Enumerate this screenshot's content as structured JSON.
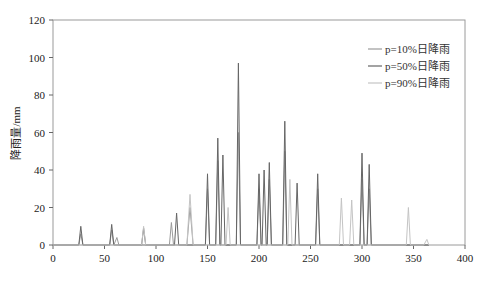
{
  "chart_data": {
    "type": "line",
    "title": "",
    "xlabel": "",
    "ylabel": "降雨量/mm",
    "xlim": [
      0,
      400
    ],
    "ylim": [
      0,
      120
    ],
    "x_ticks": [
      0,
      50,
      100,
      150,
      200,
      250,
      300,
      350,
      400
    ],
    "y_ticks": [
      0,
      20,
      40,
      60,
      80,
      100,
      120
    ],
    "grid": false,
    "legend_position": "upper-right",
    "series": [
      {
        "name": "p=10%日降雨",
        "color": "#9a9a9a",
        "points": [
          [
            0,
            0
          ],
          [
            25,
            0
          ],
          [
            27,
            6
          ],
          [
            29,
            0
          ],
          [
            55,
            0
          ],
          [
            57,
            8
          ],
          [
            59,
            0
          ],
          [
            62,
            4
          ],
          [
            64,
            0
          ],
          [
            113,
            0
          ],
          [
            115,
            12
          ],
          [
            117,
            0
          ],
          [
            130,
            0
          ],
          [
            133,
            20
          ],
          [
            136,
            0
          ],
          [
            148,
            0
          ],
          [
            150,
            30
          ],
          [
            152,
            0
          ],
          [
            158,
            0
          ],
          [
            160,
            45
          ],
          [
            162,
            0
          ],
          [
            178,
            0
          ],
          [
            180,
            60
          ],
          [
            182,
            0
          ],
          [
            198,
            0
          ],
          [
            200,
            30
          ],
          [
            202,
            0
          ],
          [
            208,
            0
          ],
          [
            210,
            35
          ],
          [
            212,
            0
          ],
          [
            223,
            0
          ],
          [
            225,
            50
          ],
          [
            227,
            0
          ],
          [
            255,
            0
          ],
          [
            257,
            30
          ],
          [
            259,
            0
          ],
          [
            298,
            0
          ],
          [
            300,
            35
          ],
          [
            302,
            0
          ],
          [
            305,
            0
          ],
          [
            307,
            30
          ],
          [
            309,
            0
          ],
          [
            365,
            0
          ]
        ]
      },
      {
        "name": "p=50%日降雨",
        "color": "#666666",
        "points": [
          [
            0,
            0
          ],
          [
            25,
            0
          ],
          [
            27,
            10
          ],
          [
            29,
            0
          ],
          [
            55,
            0
          ],
          [
            57,
            11
          ],
          [
            59,
            0
          ],
          [
            86,
            0
          ],
          [
            88,
            9
          ],
          [
            90,
            0
          ],
          [
            118,
            0
          ],
          [
            120,
            17
          ],
          [
            122,
            0
          ],
          [
            148,
            0
          ],
          [
            150,
            38
          ],
          [
            152,
            0
          ],
          [
            158,
            0
          ],
          [
            160,
            57
          ],
          [
            162,
            0
          ],
          [
            163,
            0
          ],
          [
            165,
            48
          ],
          [
            167,
            0
          ],
          [
            178,
            0
          ],
          [
            180,
            97
          ],
          [
            182,
            0
          ],
          [
            198,
            0
          ],
          [
            200,
            38
          ],
          [
            202,
            0
          ],
          [
            203,
            0
          ],
          [
            205,
            40
          ],
          [
            207,
            0
          ],
          [
            208,
            0
          ],
          [
            210,
            44
          ],
          [
            212,
            0
          ],
          [
            223,
            0
          ],
          [
            225,
            66
          ],
          [
            227,
            0
          ],
          [
            235,
            0
          ],
          [
            237,
            33
          ],
          [
            239,
            0
          ],
          [
            255,
            0
          ],
          [
            257,
            38
          ],
          [
            259,
            0
          ],
          [
            298,
            0
          ],
          [
            300,
            49
          ],
          [
            302,
            0
          ],
          [
            305,
            0
          ],
          [
            307,
            43
          ],
          [
            309,
            0
          ],
          [
            365,
            0
          ]
        ]
      },
      {
        "name": "p=90%日降雨",
        "color": "#c4c4c4",
        "points": [
          [
            0,
            0
          ],
          [
            86,
            0
          ],
          [
            88,
            10
          ],
          [
            90,
            0
          ],
          [
            130,
            0
          ],
          [
            133,
            27
          ],
          [
            136,
            0
          ],
          [
            168,
            0
          ],
          [
            170,
            20
          ],
          [
            172,
            0
          ],
          [
            228,
            0
          ],
          [
            230,
            35
          ],
          [
            232,
            0
          ],
          [
            278,
            0
          ],
          [
            280,
            25
          ],
          [
            282,
            0
          ],
          [
            288,
            0
          ],
          [
            290,
            24
          ],
          [
            292,
            0
          ],
          [
            343,
            0
          ],
          [
            345,
            20
          ],
          [
            347,
            0
          ],
          [
            360,
            0
          ],
          [
            363,
            3
          ],
          [
            365,
            0
          ]
        ]
      }
    ]
  },
  "axes": {
    "ylabel": "降雨量/mm",
    "x_tick_labels": [
      "0",
      "50",
      "100",
      "150",
      "200",
      "250",
      "300",
      "350",
      "400"
    ],
    "y_tick_labels": [
      "0",
      "20",
      "40",
      "60",
      "80",
      "100",
      "120"
    ]
  },
  "legend": {
    "items": [
      {
        "label": "p=10%日降雨",
        "color": "#9a9a9a"
      },
      {
        "label": "p=50%日降雨",
        "color": "#666666"
      },
      {
        "label": "p=90%日降雨",
        "color": "#c4c4c4"
      }
    ]
  }
}
